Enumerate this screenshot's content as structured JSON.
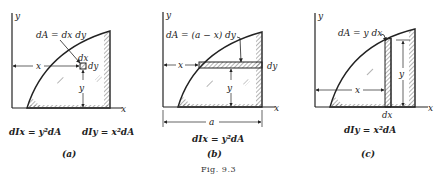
{
  "figure": {
    "caption": "Fig. 9.3",
    "panels": [
      {
        "id": "a",
        "label": "(a)",
        "axis_x": "x",
        "axis_y": "y",
        "element_label": "dA = dx dy",
        "dx_label": "dx",
        "dy_label": "dy",
        "x_dim": "x",
        "y_dim": "y",
        "formula_left": "dIx = y²dA",
        "formula_right": "dIy = x²dA"
      },
      {
        "id": "b",
        "label": "(b)",
        "axis_x": "x",
        "axis_y": "y",
        "element_label": "dA = (a − x) dy",
        "dy_label": "dy",
        "x_dim": "x",
        "y_dim": "y",
        "a_dim": "a",
        "formula": "dIx = y²dA"
      },
      {
        "id": "c",
        "label": "(c)",
        "axis_x": "x",
        "axis_y": "y",
        "element_label": "dA = y dx",
        "dx_label": "dx",
        "x_dim": "x",
        "y_dim": "y",
        "formula": "dIy = x²dA"
      }
    ]
  }
}
